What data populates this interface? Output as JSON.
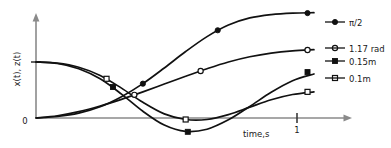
{
  "chart_data": {
    "type": "line",
    "title": "",
    "xlabel": "time,s",
    "ylabel": "x(t), z(t)",
    "xlim": [
      0,
      1.45
    ],
    "ylim": [
      -0.06,
      0.3
    ],
    "grid": false,
    "legend_position": "right-inline",
    "x_ticks": [
      {
        "value": 1,
        "label": "1"
      }
    ],
    "y_ticks": [
      {
        "value": 0,
        "label": "0"
      },
      {
        "value": 0.15,
        "label": ""
      }
    ],
    "origin_label": "0",
    "series": [
      {
        "name": "π/2",
        "label": "π/2",
        "marker": "filled-circle",
        "color": "#111111",
        "x": [
          0.0,
          0.1,
          0.2,
          0.3,
          0.4,
          0.5,
          0.6,
          0.7,
          0.8,
          0.9,
          1.0,
          1.1,
          1.2,
          1.3
        ],
        "y": [
          0.0,
          0.004,
          0.013,
          0.03,
          0.057,
          0.092,
          0.134,
          0.178,
          0.218,
          0.249,
          0.268,
          0.277,
          0.281,
          0.282
        ],
        "marker_points": [
          {
            "x": 0.5,
            "y": 0.092
          },
          {
            "x": 0.85,
            "y": 0.235
          },
          {
            "x": 1.27,
            "y": 0.281
          }
        ]
      },
      {
        "name": "1.17 rad",
        "label": "1.17 rad",
        "marker": "open-circle",
        "color": "#111111",
        "x": [
          0.0,
          0.1,
          0.2,
          0.3,
          0.4,
          0.5,
          0.6,
          0.7,
          0.8,
          0.9,
          1.0,
          1.1,
          1.2,
          1.3
        ],
        "y": [
          0.0,
          0.006,
          0.017,
          0.032,
          0.05,
          0.07,
          0.091,
          0.112,
          0.132,
          0.15,
          0.164,
          0.174,
          0.18,
          0.183
        ],
        "marker_points": [
          {
            "x": 0.46,
            "y": 0.062
          },
          {
            "x": 0.77,
            "y": 0.126
          },
          {
            "x": 1.27,
            "y": 0.182
          }
        ]
      },
      {
        "name": "0.15m",
        "label": "0.15m",
        "marker": "filled-square",
        "color": "#111111",
        "x": [
          0.0,
          0.1,
          0.2,
          0.3,
          0.4,
          0.5,
          0.6,
          0.7,
          0.8,
          0.9,
          1.0,
          1.1,
          1.2,
          1.3
        ],
        "y": [
          0.15,
          0.146,
          0.132,
          0.105,
          0.064,
          0.018,
          -0.019,
          -0.036,
          -0.03,
          -0.005,
          0.031,
          0.069,
          0.1,
          0.118
        ],
        "marker_points": [
          {
            "x": 0.36,
            "y": 0.083
          },
          {
            "x": 0.71,
            "y": -0.037
          },
          {
            "x": 1.27,
            "y": 0.123
          }
        ]
      },
      {
        "name": "0.1m",
        "label": "0.1m",
        "marker": "open-square",
        "color": "#111111",
        "x": [
          0.0,
          0.1,
          0.2,
          0.3,
          0.4,
          0.5,
          0.6,
          0.7,
          0.8,
          0.9,
          1.0,
          1.1,
          1.2,
          1.3
        ],
        "y": [
          0.15,
          0.147,
          0.136,
          0.114,
          0.08,
          0.042,
          0.011,
          -0.004,
          -0.004,
          0.009,
          0.029,
          0.049,
          0.063,
          0.07
        ],
        "marker_points": [
          {
            "x": 0.33,
            "y": 0.105
          },
          {
            "x": 0.7,
            "y": -0.004
          },
          {
            "x": 1.27,
            "y": 0.07
          }
        ]
      }
    ]
  }
}
